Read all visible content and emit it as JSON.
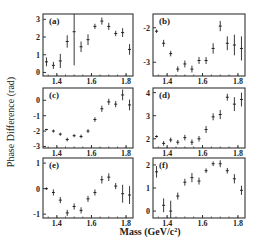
{
  "chart_data": {
    "type": "scatter",
    "ylabel": "Phase Difference (rad)",
    "xlabel": "Mass (GeV/c²)",
    "x_ticks": [
      "1.4",
      "1.6",
      "1.8"
    ],
    "x_tick_values": [
      1.4,
      1.6,
      1.8
    ],
    "xlim": [
      1.32,
      1.84
    ],
    "x": [
      1.34,
      1.38,
      1.42,
      1.46,
      1.5,
      1.54,
      1.58,
      1.62,
      1.66,
      1.7,
      1.74,
      1.78,
      1.82
    ],
    "panels": [
      {
        "label": "(a)",
        "ylim": [
          -0.2,
          3.3
        ],
        "y_ticks": [
          "0",
          "1",
          "2",
          "3"
        ],
        "y_tick_values": [
          0,
          1,
          2,
          3
        ],
        "values": [
          0.6,
          0.4,
          0.65,
          1.75,
          2.3,
          1.45,
          1.85,
          2.6,
          2.9,
          2.6,
          2.2,
          2.25,
          1.3
        ],
        "errors": [
          0.25,
          0.2,
          0.4,
          0.35,
          1.9,
          0.3,
          0.3,
          0.15,
          0.2,
          0.2,
          0.15,
          0.25,
          0.3
        ]
      },
      {
        "label": "(b)",
        "ylim": [
          -3.4,
          -1.6
        ],
        "y_ticks": [
          "-2",
          "-3"
        ],
        "y_tick_values": [
          -2,
          -3
        ],
        "values": [
          -2.1,
          -2.45,
          -2.75,
          -3.2,
          -3.05,
          -3.2,
          -2.95,
          -2.95,
          -2.6,
          -1.95,
          -2.45,
          -2.5,
          -2.6
        ],
        "errors": [
          0.05,
          0.1,
          0.08,
          0.08,
          0.1,
          0.1,
          0.1,
          0.1,
          0.15,
          0.15,
          0.2,
          0.3,
          0.35
        ]
      },
      {
        "label": "(c)",
        "ylim": [
          -3.1,
          0.8
        ],
        "y_ticks": [
          "0",
          "-1",
          "-2",
          "-3"
        ],
        "y_tick_values": [
          0,
          -1,
          -2,
          -3
        ],
        "values": [
          -1.9,
          -2.0,
          -2.2,
          -2.55,
          -2.3,
          -2.35,
          -2.0,
          -1.25,
          -0.55,
          -0.1,
          -0.25,
          0.35,
          -0.3
        ],
        "errors": [
          0.05,
          0.1,
          0.1,
          0.12,
          0.1,
          0.12,
          0.12,
          0.15,
          0.2,
          0.2,
          0.2,
          0.35,
          0.35
        ]
      },
      {
        "label": "(d)",
        "ylim": [
          1.6,
          4.2
        ],
        "y_ticks": [
          "4",
          "3",
          "2"
        ],
        "y_tick_values": [
          4,
          3,
          2
        ],
        "values": [
          2.1,
          1.8,
          1.95,
          1.85,
          2.05,
          1.85,
          2.0,
          2.4,
          2.95,
          3.05,
          3.8,
          3.5,
          3.7
        ],
        "errors": [
          0.05,
          0.1,
          0.1,
          0.1,
          0.12,
          0.12,
          0.12,
          0.15,
          0.15,
          0.2,
          0.15,
          0.3,
          0.3
        ]
      },
      {
        "label": "(e)",
        "ylim": [
          -1.15,
          1.2
        ],
        "y_ticks": [
          "1",
          "0",
          "-1"
        ],
        "y_tick_values": [
          1,
          0,
          -1
        ],
        "values": [
          0.0,
          -0.15,
          -0.45,
          -0.95,
          -0.7,
          -0.85,
          -0.4,
          -0.15,
          0.35,
          0.45,
          0.1,
          -0.2,
          -0.25
        ],
        "errors": [
          0.05,
          0.12,
          0.12,
          0.12,
          0.12,
          0.12,
          0.12,
          0.12,
          0.15,
          0.15,
          0.12,
          0.35,
          0.35
        ]
      },
      {
        "label": "(f)",
        "ylim": [
          -0.3,
          2.3
        ],
        "y_ticks": [
          "2",
          "1",
          "0"
        ],
        "y_tick_values": [
          2,
          1,
          0
        ],
        "values": [
          1.7,
          0.25,
          0.0,
          0.65,
          1.25,
          1.45,
          1.3,
          1.75,
          2.05,
          2.05,
          1.75,
          1.4,
          0.9
        ],
        "errors": [
          0.25,
          0.3,
          0.45,
          0.15,
          0.15,
          0.2,
          0.15,
          0.1,
          0.1,
          0.15,
          0.12,
          0.2,
          0.2
        ]
      }
    ]
  }
}
